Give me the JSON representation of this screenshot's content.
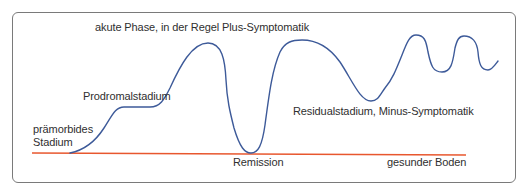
{
  "diagram": {
    "title": "",
    "colors": {
      "curve": "#3d5a99",
      "baseline": "#e8572e",
      "frame": "#7a7a7a",
      "text": "#2f2f2f"
    },
    "labels": {
      "acute_phase": "akute Phase, in der Regel Plus-Symptomatik",
      "prodromal": "Prodromalstadium",
      "premorbid_line1": "prämorbides",
      "premorbid_line2": "Stadium",
      "remission": "Remission",
      "residual": "Residualstadium, Minus-Symptomatik",
      "healthy_ground": "gesunder Boden"
    },
    "curve_keypoints": [
      {
        "stage": "prämorbides Stadium",
        "x": 70,
        "y": 153
      },
      {
        "stage": "Prodromalstadium plateau",
        "x": 120,
        "y": 107
      },
      {
        "stage": "Prodromalstadium plateau end",
        "x": 155,
        "y": 107
      },
      {
        "stage": "akute Phase peak",
        "x": 208,
        "y": 43
      },
      {
        "stage": "Remission trough",
        "x": 251,
        "y": 153
      },
      {
        "stage": "second acute peak",
        "x": 300,
        "y": 40
      },
      {
        "stage": "Residualstadium trough",
        "x": 370,
        "y": 101
      },
      {
        "stage": "relapse peak 1",
        "x": 415,
        "y": 35
      },
      {
        "stage": "residual dip 1",
        "x": 440,
        "y": 70
      },
      {
        "stage": "relapse peak 2",
        "x": 463,
        "y": 36
      },
      {
        "stage": "residual dip 2",
        "x": 485,
        "y": 70
      },
      {
        "stage": "end",
        "x": 497,
        "y": 61
      }
    ]
  }
}
